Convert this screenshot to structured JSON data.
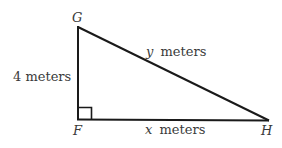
{
  "figure": {
    "type": "right-triangle",
    "vertices": [
      {
        "name": "G",
        "label": "G",
        "x": 78,
        "y": 27
      },
      {
        "name": "F",
        "label": "F",
        "x": 78,
        "y": 119
      },
      {
        "name": "H",
        "label": "H",
        "x": 268,
        "y": 120
      }
    ],
    "right_angle_at": "F",
    "sides": {
      "GF": {
        "label": "4 meters",
        "value": "4",
        "unit": "meters"
      },
      "GH": {
        "label_var": "y",
        "label_unit": "meters"
      },
      "FH": {
        "label_var": "x",
        "label_unit": "meters"
      }
    },
    "colors": {
      "line": "#1a1a1a",
      "text": "#3a3a3a",
      "background": "#ffffff"
    }
  }
}
